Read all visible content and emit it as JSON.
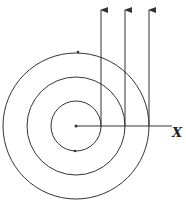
{
  "diagram": {
    "type": "concentric-circles-with-tangent-arrows",
    "center": {
      "x": 76,
      "y": 126
    },
    "circles": [
      {
        "name": "inner",
        "radius": 25
      },
      {
        "name": "middle",
        "radius": 49
      },
      {
        "name": "outer",
        "radius": 73
      }
    ],
    "arrows": [
      {
        "x": 101,
        "y_start": 126,
        "y_end": 10
      },
      {
        "x": 125,
        "y_start": 126,
        "y_end": 10
      },
      {
        "x": 149,
        "y_start": 126,
        "y_end": 10
      }
    ],
    "axis": {
      "label": "X",
      "x_start": 76,
      "x_end": 172,
      "y": 126
    },
    "dots": [
      {
        "x": 78,
        "y": 52
      },
      {
        "x": 75,
        "y": 151
      }
    ],
    "colors": {
      "stroke": "#333333",
      "background": "#ffffff"
    }
  }
}
